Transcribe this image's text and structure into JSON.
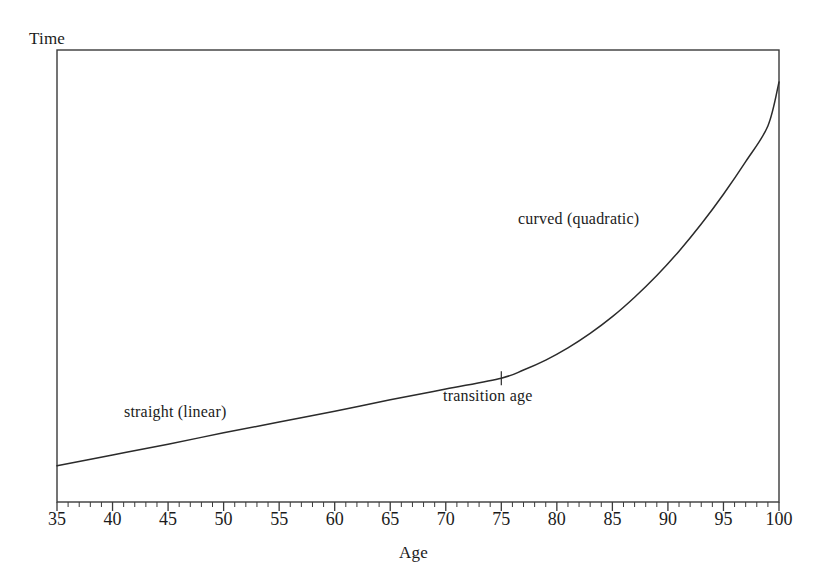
{
  "chart_data": {
    "type": "line",
    "title": "",
    "xlabel": "Age",
    "ylabel": "Time",
    "xlim": [
      35,
      100
    ],
    "ylim": [
      0,
      1
    ],
    "grid": false,
    "legend": "none",
    "x_major_ticks": [
      35,
      40,
      45,
      50,
      55,
      60,
      65,
      70,
      75,
      80,
      85,
      90,
      95,
      100
    ],
    "x_tick_labels": [
      "35",
      "40",
      "45",
      "50",
      "55",
      "60",
      "65",
      "70",
      "75",
      "80",
      "85",
      "90",
      "95",
      "100"
    ],
    "x_minor_tick_step": 1,
    "y_ticks": [],
    "y_tick_labels": [],
    "series": [
      {
        "name": "Time",
        "color": "#2b2b2b",
        "x": [
          35,
          40,
          45,
          50,
          55,
          60,
          65,
          70,
          75,
          77,
          79,
          81,
          83,
          85,
          87,
          89,
          91,
          93,
          95,
          97,
          99,
          100
        ],
        "values": [
          0.08,
          0.104,
          0.128,
          0.153,
          0.177,
          0.201,
          0.226,
          0.25,
          0.274,
          0.292,
          0.314,
          0.341,
          0.373,
          0.41,
          0.453,
          0.501,
          0.555,
          0.615,
          0.681,
          0.753,
          0.832,
          0.929
        ]
      }
    ],
    "annotations": [
      {
        "id": "linear",
        "text": "straight (linear)",
        "x": 41,
        "y": 0.225
      },
      {
        "id": "quadratic",
        "text": "curved (quadratic)",
        "x": 76,
        "y": 0.65
      },
      {
        "id": "transition",
        "text": "transition age",
        "x": 75,
        "y": 0.255
      }
    ],
    "markers": [
      {
        "id": "transition-marker",
        "shape": "cross",
        "x": 75,
        "y": 0.274
      }
    ]
  },
  "axes": {
    "y_axis_title": "Time",
    "x_axis_title": "Age"
  },
  "annotations": {
    "linear_label": "straight (linear)",
    "quadratic_label": "curved (quadratic)",
    "transition_label": "transition age"
  },
  "ticks": {
    "labels": [
      "35",
      "40",
      "45",
      "50",
      "55",
      "60",
      "65",
      "70",
      "75",
      "80",
      "85",
      "90",
      "95",
      "100"
    ]
  },
  "colors": {
    "line": "#2b2b2b",
    "axis": "#3a3a3a",
    "text": "#1b1b1b",
    "background": "#ffffff"
  }
}
